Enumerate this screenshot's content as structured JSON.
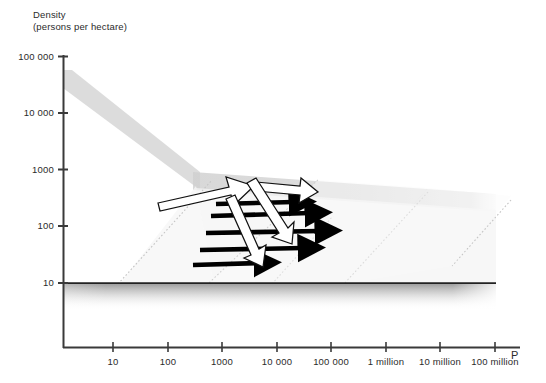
{
  "chart_data": {
    "type": "scatter",
    "title": "",
    "subtitle": "",
    "ylabel_line1": "Density",
    "ylabel_line2": "(persons per hectare)",
    "xlabel": "P",
    "xscale": "log",
    "yscale": "log",
    "grid": false,
    "legend": "none",
    "xlim": [
      1,
      1000000000
    ],
    "ylim": [
      1,
      100000
    ],
    "y_ticks": [
      {
        "label": "100 000",
        "value": 100000,
        "py": 57
      },
      {
        "label": "10 000",
        "value": 10000,
        "py": 113
      },
      {
        "label": "1000",
        "value": 1000,
        "py": 170
      },
      {
        "label": "100",
        "value": 100,
        "py": 226
      },
      {
        "label": "10",
        "value": 10,
        "py": 283
      }
    ],
    "x_ticks": [
      {
        "label": "10",
        "value": 10,
        "px": 113
      },
      {
        "label": "100",
        "value": 100,
        "px": 168
      },
      {
        "label": "1000",
        "value": 1000,
        "px": 222
      },
      {
        "label": "10 000",
        "value": 10000,
        "px": 277
      },
      {
        "label": "100 000",
        "value": 100000,
        "px": 331
      },
      {
        "label": "1 million",
        "value": 1000000,
        "px": 386
      },
      {
        "label": "10 million",
        "value": 10000000,
        "px": 440
      },
      {
        "label": "100 million",
        "value": 100000000,
        "px": 495
      }
    ],
    "bands": [
      {
        "name": "main-density-band",
        "description": "Grey band descending steeply then flattening",
        "points": [
          [
            63,
            72
          ],
          [
            195,
            172
          ],
          [
            495,
            196
          ],
          [
            495,
            214
          ],
          [
            195,
            188
          ],
          [
            63,
            88
          ]
        ],
        "color": "#d9d9d9"
      },
      {
        "name": "lower-threshold-band",
        "description": "Horizontal dark rule at density 10 with grey fade below",
        "y": 283,
        "x_start": 63,
        "x_end": 495,
        "color": "#2b2b2b"
      }
    ],
    "guide_lines": [
      {
        "name": "guide-up-right-1",
        "x1": 118,
        "y1": 283,
        "x2": 215,
        "y2": 178
      },
      {
        "name": "guide-up-right-2",
        "x1": 270,
        "y1": 283,
        "x2": 330,
        "y2": 215
      },
      {
        "name": "guide-down-right-1",
        "x1": 316,
        "y1": 180,
        "x2": 210,
        "y2": 283
      },
      {
        "name": "guide-down-right-2",
        "x1": 425,
        "y1": 192,
        "x2": 345,
        "y2": 283
      },
      {
        "name": "guide-down-right-3",
        "x1": 508,
        "y1": 199,
        "x2": 455,
        "y2": 266
      }
    ],
    "black_arrows": [
      {
        "name": "black-arrow-1",
        "x1": 216,
        "y1": 204,
        "x2": 300,
        "y2": 202
      },
      {
        "name": "black-arrow-2",
        "x1": 211,
        "y1": 216,
        "x2": 316,
        "y2": 213
      },
      {
        "name": "black-arrow-3",
        "x1": 206,
        "y1": 233,
        "x2": 326,
        "y2": 231
      },
      {
        "name": "black-arrow-4",
        "x1": 200,
        "y1": 250,
        "x2": 309,
        "y2": 248
      },
      {
        "name": "black-arrow-5",
        "x1": 193,
        "y1": 265,
        "x2": 265,
        "y2": 263
      }
    ],
    "white_arrows": [
      {
        "name": "white-arrow-up-left",
        "x1": 159,
        "y1": 199,
        "x2": 247,
        "y2": 180
      },
      {
        "name": "white-arrow-right-top",
        "x1": 253,
        "y1": 185,
        "x2": 313,
        "y2": 192
      },
      {
        "name": "white-arrow-diagonal-1",
        "x1": 249,
        "y1": 185,
        "x2": 282,
        "y2": 234
      },
      {
        "name": "white-arrow-diagonal-2",
        "x1": 228,
        "y1": 202,
        "x2": 249,
        "y2": 260
      }
    ],
    "colors": {
      "axis": "#3a3a3a",
      "band_grey": "#d5d5d5",
      "guide_grey": "#bcbcbc",
      "arrow_black": "#000000",
      "arrow_white_fill": "#ffffff",
      "arrow_white_stroke": "#111111",
      "text": "#2b2b2b"
    }
  }
}
